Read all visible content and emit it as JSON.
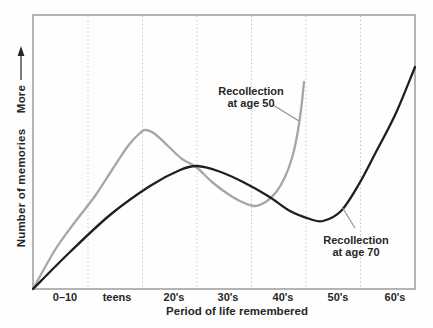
{
  "figure": {
    "background": "#fefefe",
    "text_color": "#262626"
  },
  "chart_data": {
    "type": "line",
    "title": "",
    "xlabel": "Period of life remembered",
    "ylabel": "Number of memories",
    "y_arrow_label": "More",
    "y_axis_scale": "qualitative, arrow pointing up meaning more memories",
    "grid": "vertical dotted gridlines between decade bands",
    "legend_position": "inline labels with leader lines",
    "x_tick_labels": [
      "0–10",
      "teens",
      "20's",
      "30's",
      "40's",
      "50's",
      "60's"
    ],
    "series": [
      {
        "name": "Recollection at age 50",
        "label_lines": [
          "Recollection",
          "at age 50"
        ],
        "color": "#a6a6a6",
        "shape_summary": "rises steeply from childhood, peaks sharply in the late teens, declines to a dip during the 30s, then climbs near-vertically approaching the mid-40s (recent past at age 50)",
        "points_px": [
          [
            33,
            289
          ],
          [
            55,
            250
          ],
          [
            75,
            222
          ],
          [
            95,
            196
          ],
          [
            112,
            170
          ],
          [
            128,
            146
          ],
          [
            140,
            133
          ],
          [
            146,
            130
          ],
          [
            155,
            134
          ],
          [
            168,
            146
          ],
          [
            182,
            159
          ],
          [
            196,
            167
          ],
          [
            212,
            182
          ],
          [
            228,
            194
          ],
          [
            242,
            202
          ],
          [
            255,
            206
          ],
          [
            267,
            201
          ],
          [
            277,
            191
          ],
          [
            285,
            177
          ],
          [
            292,
            158
          ],
          [
            297,
            136
          ],
          [
            301,
            110
          ],
          [
            304,
            82
          ]
        ]
      },
      {
        "name": "Recollection at age 70",
        "label_lines": [
          "Recollection",
          "at age 70"
        ],
        "color": "#1f1f1f",
        "shape_summary": "rises from childhood to a broad peak around the 20s (reminiscence bump), dips to a minimum in the late 40s, then rises steeply through the 50s and 60s (recent past at age 70)",
        "points_px": [
          [
            33,
            289
          ],
          [
            70,
            252
          ],
          [
            110,
            215
          ],
          [
            150,
            186
          ],
          [
            180,
            170
          ],
          [
            197,
            166
          ],
          [
            218,
            171
          ],
          [
            243,
            182
          ],
          [
            268,
            196
          ],
          [
            290,
            211
          ],
          [
            310,
            219
          ],
          [
            323,
            221
          ],
          [
            341,
            211
          ],
          [
            359,
            184
          ],
          [
            377,
            150
          ],
          [
            396,
            113
          ],
          [
            415,
            67
          ]
        ]
      }
    ],
    "plot_box_px": {
      "left": 33,
      "top": 15,
      "right": 415,
      "bottom": 289
    },
    "gridlines_x_px": [
      88,
      142.5,
      197,
      251.5,
      306,
      360.5
    ],
    "x_tick_centers_px": [
      65,
      117,
      174,
      228,
      283,
      338,
      395
    ],
    "leader_lines": [
      {
        "series": "Recollection at age 50",
        "from": [
          273,
          105
        ],
        "to": [
          299,
          121
        ]
      },
      {
        "series": "Recollection at age 70",
        "from": [
          342,
          207
        ],
        "to": [
          355,
          228
        ]
      }
    ],
    "y_arrow_px": {
      "x": 21,
      "line_from_y": 80,
      "line_to_y": 54,
      "tip_y": 46
    },
    "label_centers_px": {
      "age50": [
        251,
        97
      ],
      "age70": [
        356,
        246
      ],
      "more": [
        21,
        99
      ],
      "ylabel": [
        21,
        188
      ],
      "xlabel": [
        237,
        311
      ]
    }
  },
  "style": {
    "curve_width": 2.3,
    "grid_color": "#bfbfbf",
    "border_color": "#949494",
    "leader_color": "#8f8f8f"
  }
}
